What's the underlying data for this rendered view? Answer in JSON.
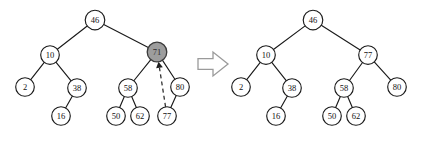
{
  "figure": {
    "transition_icon": "right-block-arrow-icon",
    "colors": {
      "stroke": "#1a1a1a",
      "node_fill": "#ffffff",
      "highlight_fill": "#9d9d9d",
      "arrow_outline": "#9a9a9a",
      "text": "#111111"
    },
    "panels": [
      {
        "name": "before",
        "caption": "",
        "nodes": [
          {
            "id": "L46",
            "label": "46",
            "cx": 95,
            "cy": 20,
            "r": 9.8,
            "highlight": false
          },
          {
            "id": "L10",
            "label": "10",
            "cx": 50,
            "cy": 55,
            "r": 9.3,
            "highlight": false
          },
          {
            "id": "L71",
            "label": "71",
            "cx": 157,
            "cy": 52,
            "r": 9.8,
            "highlight": true
          },
          {
            "id": "L2",
            "label": "2",
            "cx": 25,
            "cy": 87,
            "r": 9.3,
            "highlight": false
          },
          {
            "id": "L38",
            "label": "38",
            "cx": 77,
            "cy": 88,
            "r": 9.3,
            "highlight": false
          },
          {
            "id": "L58",
            "label": "58",
            "cx": 128,
            "cy": 88,
            "r": 9.3,
            "highlight": false
          },
          {
            "id": "L80",
            "label": "80",
            "cx": 180,
            "cy": 87,
            "r": 9.3,
            "highlight": false
          },
          {
            "id": "L16",
            "label": "16",
            "cx": 61,
            "cy": 116,
            "r": 9.3,
            "highlight": false
          },
          {
            "id": "L50",
            "label": "50",
            "cx": 116,
            "cy": 116,
            "r": 9.3,
            "highlight": false
          },
          {
            "id": "L62",
            "label": "62",
            "cx": 140,
            "cy": 116,
            "r": 9.3,
            "highlight": false
          },
          {
            "id": "L77",
            "label": "77",
            "cx": 167,
            "cy": 116,
            "r": 9.3,
            "highlight": false
          }
        ],
        "edges": [
          [
            "L46",
            "L10"
          ],
          [
            "L46",
            "L71"
          ],
          [
            "L10",
            "L2"
          ],
          [
            "L10",
            "L38"
          ],
          [
            "L38",
            "L16"
          ],
          [
            "L71",
            "L58"
          ],
          [
            "L71",
            "L80"
          ],
          [
            "L58",
            "L50"
          ],
          [
            "L58",
            "L62"
          ],
          [
            "L80",
            "L77"
          ]
        ],
        "dashed_edges": [
          {
            "from": "L77",
            "to": "L71",
            "style": "dashed-arrow"
          }
        ]
      },
      {
        "name": "after",
        "caption": "",
        "nodes": [
          {
            "id": "R46",
            "label": "46",
            "cx": 313,
            "cy": 20,
            "r": 9.8,
            "highlight": false
          },
          {
            "id": "R10",
            "label": "10",
            "cx": 266,
            "cy": 55,
            "r": 9.3,
            "highlight": false
          },
          {
            "id": "R77",
            "label": "77",
            "cx": 368,
            "cy": 55,
            "r": 9.3,
            "highlight": false
          },
          {
            "id": "R2",
            "label": "2",
            "cx": 241,
            "cy": 87,
            "r": 9.3,
            "highlight": false
          },
          {
            "id": "R38",
            "label": "38",
            "cx": 292,
            "cy": 88,
            "r": 9.3,
            "highlight": false
          },
          {
            "id": "R58",
            "label": "58",
            "cx": 344,
            "cy": 88,
            "r": 9.3,
            "highlight": false
          },
          {
            "id": "R80",
            "label": "80",
            "cx": 397,
            "cy": 87,
            "r": 9.3,
            "highlight": false
          },
          {
            "id": "R16",
            "label": "16",
            "cx": 276,
            "cy": 116,
            "r": 9.3,
            "highlight": false
          },
          {
            "id": "R50",
            "label": "50",
            "cx": 332,
            "cy": 116,
            "r": 9.3,
            "highlight": false
          },
          {
            "id": "R62",
            "label": "62",
            "cx": 356,
            "cy": 116,
            "r": 9.3,
            "highlight": false
          }
        ],
        "edges": [
          [
            "R46",
            "R10"
          ],
          [
            "R46",
            "R77"
          ],
          [
            "R10",
            "R2"
          ],
          [
            "R10",
            "R38"
          ],
          [
            "R38",
            "R16"
          ],
          [
            "R77",
            "R58"
          ],
          [
            "R77",
            "R80"
          ],
          [
            "R58",
            "R50"
          ],
          [
            "R58",
            "R62"
          ]
        ],
        "dashed_edges": []
      }
    ],
    "transition": {
      "x": 198,
      "y": 52,
      "width": 30,
      "height": 24
    }
  }
}
